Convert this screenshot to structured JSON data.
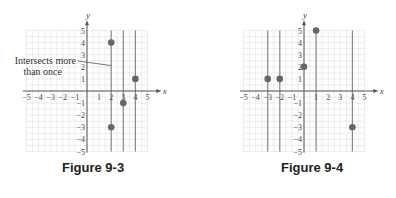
{
  "figures": [
    {
      "caption": "Figure 9-3",
      "annotation": "Intersects more than once",
      "annotation_line1": "Intersects more",
      "annotation_line2": "than once"
    },
    {
      "caption": "Figure 9-4"
    }
  ],
  "chart_data": [
    {
      "type": "scatter",
      "title": "Figure 9-3",
      "xlabel": "x",
      "ylabel": "y",
      "xlim": [
        -5,
        5
      ],
      "ylim": [
        -5,
        5
      ],
      "grid": true,
      "x_ticks": [
        -5,
        -4,
        -3,
        -2,
        -1,
        1,
        2,
        3,
        4,
        5
      ],
      "y_ticks": [
        -5,
        -4,
        -3,
        -2,
        -1,
        1,
        2,
        3,
        4,
        5
      ],
      "points": [
        [
          2,
          4
        ],
        [
          2,
          -3
        ],
        [
          3,
          -1
        ],
        [
          4,
          1
        ]
      ],
      "vertical_lines": [
        2,
        3,
        4
      ],
      "annotations": [
        {
          "text": "Intersects more than once",
          "points_to": [
            2,
            2.1
          ]
        }
      ]
    },
    {
      "type": "scatter",
      "title": "Figure 9-4",
      "xlabel": "x",
      "ylabel": "y",
      "xlim": [
        -5,
        5
      ],
      "ylim": [
        -5,
        5
      ],
      "grid": true,
      "x_ticks": [
        -5,
        -4,
        -3,
        -2,
        -1,
        1,
        2,
        3,
        4,
        5
      ],
      "y_ticks": [
        -5,
        -4,
        -3,
        -2,
        -1,
        1,
        2,
        3,
        4,
        5
      ],
      "points": [
        [
          -3,
          1
        ],
        [
          -2,
          1
        ],
        [
          0,
          2
        ],
        [
          1,
          5
        ],
        [
          4,
          -3
        ]
      ],
      "vertical_lines": [
        -3,
        -2,
        1,
        4
      ]
    }
  ]
}
